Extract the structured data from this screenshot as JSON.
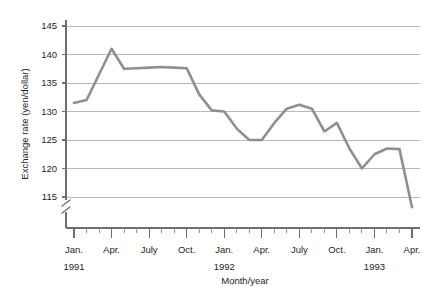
{
  "chart_data": {
    "type": "line",
    "title": "",
    "xlabel": "Month/year",
    "ylabel": "Exchange rate (yen/dollar)",
    "ylim": [
      115,
      145
    ],
    "yticks": [
      115,
      120,
      125,
      130,
      135,
      140,
      145
    ],
    "ytick_labels": [
      "115",
      "120",
      "125",
      "130",
      "135",
      "140",
      "145"
    ],
    "grid": true,
    "y_axis_broken": true,
    "legend": "none",
    "series_color": "#8f8f8f",
    "grid_color": "#a7a7a7",
    "axis_color": "#6d6d6d",
    "x": [
      "Jan. 1991",
      "Feb. 1991",
      "Mar. 1991",
      "Apr. 1991",
      "May 1991",
      "June 1991",
      "July 1991",
      "Aug. 1991",
      "Sept. 1991",
      "Oct. 1991",
      "Nov. 1991",
      "Dec. 1991",
      "Jan. 1992",
      "Feb. 1992",
      "Mar. 1992",
      "Apr. 1992",
      "May 1992",
      "June 1992",
      "July 1992",
      "Aug. 1992",
      "Sept. 1992",
      "Oct. 1992",
      "Nov. 1992",
      "Dec. 1992",
      "Jan. 1993",
      "Feb. 1993",
      "Mar. 1993",
      "Apr. 1993"
    ],
    "values": [
      131.5,
      132.0,
      136.5,
      141.0,
      137.5,
      137.6,
      137.7,
      137.8,
      137.7,
      137.6,
      133.0,
      130.2,
      130.0,
      127.0,
      125.0,
      125.0,
      128.0,
      130.5,
      131.2,
      130.5,
      126.5,
      128.0,
      123.5,
      120.0,
      122.5,
      123.5,
      123.4,
      113.2
    ],
    "xtick_major_labels": [
      "Jan.",
      "Apr.",
      "July",
      "Oct.",
      "Jan.",
      "Apr.",
      "July",
      "Oct.",
      "Jan.",
      "Apr."
    ],
    "xtick_major_indices": [
      0,
      3,
      6,
      9,
      12,
      15,
      18,
      21,
      24,
      27
    ],
    "year_labels": [
      {
        "text": "1991",
        "index": 0
      },
      {
        "text": "1992",
        "index": 12
      },
      {
        "text": "1993",
        "index": 24
      }
    ],
    "n_minor_ticks": 28
  }
}
